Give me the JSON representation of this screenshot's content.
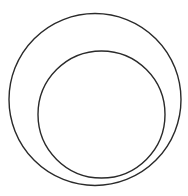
{
  "diagram": {
    "background": "#ffffff",
    "stroke_color": "#2a2a2a",
    "stroke_width": 1.4,
    "shapes": [
      {
        "name": "outer-circle",
        "cx": 95,
        "cy": 99.5,
        "r": 86
      },
      {
        "name": "inner-circle",
        "cx": 101.5,
        "cy": 114.5,
        "r": 63.5
      }
    ]
  }
}
